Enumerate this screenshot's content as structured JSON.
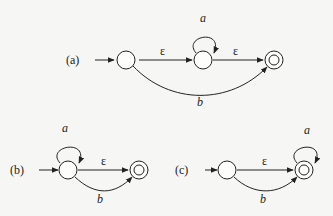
{
  "diagrams": [
    {
      "label": "(a)",
      "states": [
        "start",
        "middle",
        "final (accepting)"
      ],
      "transitions": [
        {
          "from": "start",
          "to": "middle",
          "symbol": "ε"
        },
        {
          "from": "middle",
          "to": "middle",
          "symbol": "a"
        },
        {
          "from": "middle",
          "to": "final",
          "symbol": "ε"
        },
        {
          "from": "start",
          "to": "final",
          "symbol": "b"
        }
      ]
    },
    {
      "label": "(b)",
      "states": [
        "start",
        "final (accepting)"
      ],
      "transitions": [
        {
          "from": "start",
          "to": "start",
          "symbol": "a"
        },
        {
          "from": "start",
          "to": "final",
          "symbol": "ε"
        },
        {
          "from": "start",
          "to": "final",
          "symbol": "b"
        }
      ]
    },
    {
      "label": "(c)",
      "states": [
        "start",
        "final (accepting)"
      ],
      "transitions": [
        {
          "from": "start",
          "to": "final",
          "symbol": "ε"
        },
        {
          "from": "start",
          "to": "final",
          "symbol": "b"
        },
        {
          "from": "final",
          "to": "final",
          "symbol": "a"
        }
      ]
    }
  ],
  "symbols": {
    "eps": "ε",
    "a": "a",
    "b": "b"
  }
}
